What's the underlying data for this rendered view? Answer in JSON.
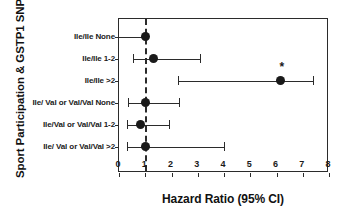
{
  "chart_data": {
    "type": "scatter",
    "plot_style": "forest-plot",
    "title": "",
    "xlabel": "Hazard Ratio (95% CI)",
    "ylabel": "Sport Participation & GSTP1 SNP",
    "xlim": [
      0,
      8
    ],
    "ylim": [
      0,
      7
    ],
    "xticks": [
      0,
      1,
      2,
      3,
      4,
      5,
      6,
      7,
      8
    ],
    "xticklabels": [
      "0",
      "1",
      "2",
      "3",
      "4",
      "5",
      "6",
      "7",
      "8"
    ],
    "grid": false,
    "legend": null,
    "reference_line": {
      "value": 1.0,
      "style": "dashed",
      "color": "#2b2b2b"
    },
    "categories": [
      "Ile/Ile None",
      "Ile/Ile 1-2",
      "Ile/Ile >2",
      "Ile/ Val or Val/Val None",
      "Ile/Val or Val/Val 1-2",
      "Ile/ Val or Val/Val >2"
    ],
    "values": [
      1.0,
      1.3,
      6.15,
      1.0,
      0.8,
      1.0
    ],
    "ci_low": [
      0.0,
      0.55,
      2.25,
      0.35,
      0.3,
      0.3
    ],
    "ci_high": [
      1.0,
      3.1,
      7.4,
      2.3,
      1.9,
      4.0
    ],
    "annotations": [
      {
        "category": "Ile/Ile >2",
        "text": "*",
        "x": 6.2,
        "meaning": "statistically-significant"
      }
    ],
    "points": [
      {
        "label": "Ile/Ile None",
        "hr": 1.0,
        "ci_low": 0.0,
        "ci_high": 1.0,
        "reference": true,
        "significant": false
      },
      {
        "label": "Ile/Ile 1-2",
        "hr": 1.3,
        "ci_low": 0.55,
        "ci_high": 3.1,
        "reference": false,
        "significant": false
      },
      {
        "label": "Ile/Ile >2",
        "hr": 6.15,
        "ci_low": 2.25,
        "ci_high": 7.4,
        "reference": false,
        "significant": true
      },
      {
        "label": "Ile/ Val or Val/Val None",
        "hr": 1.0,
        "ci_low": 0.35,
        "ci_high": 2.3,
        "reference": false,
        "significant": false
      },
      {
        "label": "Ile/Val or Val/Val 1-2",
        "hr": 0.8,
        "ci_low": 0.3,
        "ci_high": 1.9,
        "reference": false,
        "significant": false
      },
      {
        "label": "Ile/ Val or Val/Val >2",
        "hr": 1.0,
        "ci_low": 0.3,
        "ci_high": 4.0,
        "reference": false,
        "significant": false
      }
    ],
    "colors": {
      "marker": "#1a1a1a",
      "line": "#2b2b2b",
      "axis": "#2b2b2b",
      "background": "#ffffff"
    }
  }
}
